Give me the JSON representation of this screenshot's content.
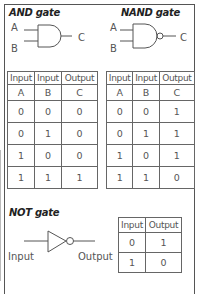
{
  "and_gate": {
    "title": "AND gate",
    "input_a_label": "A",
    "input_b_label": "B",
    "output_label": "C",
    "table": {
      "headers": [
        "Input",
        "Input",
        "Output"
      ],
      "subheaders": [
        "A",
        "B",
        "C"
      ],
      "rows": [
        [
          "0",
          "0",
          "0"
        ],
        [
          "0",
          "1",
          "0"
        ],
        [
          "1",
          "0",
          "0"
        ],
        [
          "1",
          "1",
          "1"
        ]
      ]
    }
  },
  "nand_gate": {
    "title": "NAND gate",
    "input_a_label": "A",
    "input_b_label": "B",
    "output_label": "C",
    "table": {
      "headers": [
        "Input",
        "Input",
        "Output"
      ],
      "subheaders": [
        "A",
        "B",
        "C"
      ],
      "rows": [
        [
          "0",
          "0",
          "1"
        ],
        [
          "0",
          "1",
          "1"
        ],
        [
          "1",
          "0",
          "1"
        ],
        [
          "1",
          "1",
          "0"
        ]
      ]
    }
  },
  "not_gate": {
    "title": "NOT gate",
    "input_label": "Input",
    "output_label": "Output",
    "table": {
      "headers": [
        "Input",
        "Output"
      ],
      "rows": [
        [
          "0",
          "1"
        ],
        [
          "1",
          "0"
        ]
      ]
    }
  }
}
